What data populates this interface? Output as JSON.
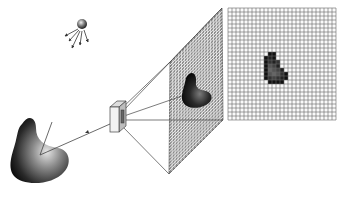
{
  "diagram": {
    "colors": {
      "background": "#ffffff",
      "line": "#444444",
      "grid_line": "#555555",
      "object_dark": "#0a0a0a",
      "object_light": "#d8d8d8",
      "camera_face": "#f2f2f2",
      "camera_side": "#bdbdbd"
    },
    "light_source": {
      "cx": 82,
      "cy": 24,
      "r": 5,
      "rays": 5
    },
    "object": {
      "highlight": [
        40,
        155
      ]
    },
    "camera": {
      "x": 110,
      "y": 106
    },
    "image_plane": {
      "corners": [
        [
          170,
          62
        ],
        [
          222,
          8
        ],
        [
          223,
          120
        ],
        [
          169,
          174
        ]
      ],
      "grid_rows": 36,
      "grid_cols": 18
    },
    "pixel_grid": {
      "x": 228,
      "y": 8,
      "width": 108,
      "height": 112,
      "rows": 28,
      "cols": 27,
      "dark_pixels": [
        [
          11,
          10,
          "#111"
        ],
        [
          11,
          11,
          "#111"
        ],
        [
          12,
          9,
          "#111"
        ],
        [
          12,
          10,
          "#222"
        ],
        [
          12,
          11,
          "#111"
        ],
        [
          13,
          9,
          "#111"
        ],
        [
          13,
          10,
          "#333"
        ],
        [
          13,
          11,
          "#222"
        ],
        [
          13,
          12,
          "#333"
        ],
        [
          14,
          9,
          "#111"
        ],
        [
          14,
          10,
          "#555"
        ],
        [
          14,
          11,
          "#444"
        ],
        [
          14,
          12,
          "#222"
        ],
        [
          15,
          9,
          "#111"
        ],
        [
          15,
          10,
          "#666"
        ],
        [
          15,
          11,
          "#555"
        ],
        [
          15,
          12,
          "#444"
        ],
        [
          15,
          13,
          "#222"
        ],
        [
          16,
          9,
          "#111"
        ],
        [
          16,
          10,
          "#555"
        ],
        [
          16,
          11,
          "#666"
        ],
        [
          16,
          12,
          "#555"
        ],
        [
          16,
          13,
          "#333"
        ],
        [
          16,
          14,
          "#111"
        ],
        [
          17,
          9,
          "#111"
        ],
        [
          17,
          10,
          "#333"
        ],
        [
          17,
          11,
          "#444"
        ],
        [
          17,
          12,
          "#333"
        ],
        [
          17,
          13,
          "#222"
        ],
        [
          17,
          14,
          "#111"
        ],
        [
          18,
          10,
          "#111"
        ],
        [
          18,
          11,
          "#111"
        ],
        [
          18,
          12,
          "#111"
        ],
        [
          18,
          13,
          "#111"
        ]
      ]
    }
  }
}
